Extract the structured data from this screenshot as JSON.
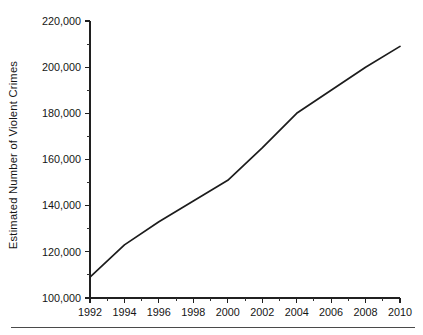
{
  "chart_data": {
    "type": "line",
    "title": "",
    "xlabel": "",
    "ylabel": "Estimated Number of Violent Crimes",
    "xlim": [
      1992,
      2010
    ],
    "ylim": [
      100000,
      220000
    ],
    "grid": false,
    "legend": null,
    "x_tick_labels": [
      "1992",
      "1994",
      "1996",
      "1998",
      "2000",
      "2002",
      "2004",
      "2006",
      "2008",
      "2010"
    ],
    "x_tick_values": [
      1992,
      1994,
      1996,
      1998,
      2000,
      2002,
      2004,
      2006,
      2008,
      2010
    ],
    "x_minor_tick_values": [
      1993,
      1995,
      1997,
      1999,
      2001,
      2003,
      2005,
      2007,
      2009
    ],
    "y_tick_labels": [
      "100,000",
      "120,000",
      "140,000",
      "160,000",
      "180,000",
      "200,000",
      "220,000"
    ],
    "y_tick_values": [
      100000,
      120000,
      140000,
      160000,
      180000,
      200000,
      220000
    ],
    "y_minor_tick_values": [
      110000,
      130000,
      150000,
      170000,
      190000,
      210000
    ],
    "series": [
      {
        "name": "Estimated Number of Violent Crimes",
        "color": "#1c1c1c",
        "x": [
          1992,
          1994,
          1996,
          1998,
          2000,
          2002,
          2004,
          2006,
          2008,
          2010
        ],
        "values": [
          109000,
          130000,
          151000,
          141000,
          151000,
          166000,
          180000,
          190000,
          200000,
          209000
        ]
      }
    ],
    "data_points": [
      {
        "x": 1992,
        "y": 109000
      },
      {
        "x": 1994,
        "y": 123000
      },
      {
        "x": 1996,
        "y": 133000
      },
      {
        "x": 1998,
        "y": 142000
      },
      {
        "x": 2000,
        "y": 151000
      },
      {
        "x": 2002,
        "y": 165000
      },
      {
        "x": 2004,
        "y": 180000
      },
      {
        "x": 2006,
        "y": 190000
      },
      {
        "x": 2008,
        "y": 200000
      },
      {
        "x": 2010,
        "y": 209000
      }
    ]
  }
}
